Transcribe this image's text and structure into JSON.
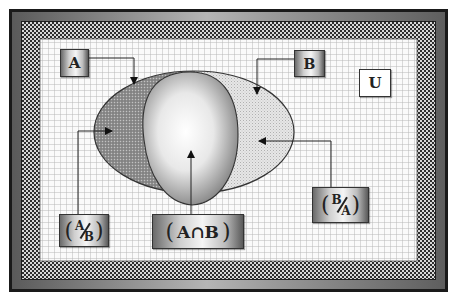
{
  "diagram": {
    "type": "venn",
    "universe_label": "U",
    "sets": [
      {
        "id": "A",
        "label": "A"
      },
      {
        "id": "B",
        "label": "B"
      }
    ],
    "regions": [
      {
        "id": "a_minus_b",
        "label": "A/B",
        "numerator": "A",
        "denominator": "B"
      },
      {
        "id": "a_intersect_b",
        "label": "(A∩B)",
        "open": "(",
        "text": "A∩B",
        "close": ")"
      },
      {
        "id": "b_minus_a",
        "label": "B/A",
        "numerator": "B",
        "denominator": "A"
      }
    ],
    "paren_open": "(",
    "paren_close": ")"
  },
  "colors": {
    "frame_dark": "#1a1a1a",
    "frame_mid": "#8c8c8c",
    "checker_dark": "#2e2e2e",
    "checker_light": "#d8d8d8",
    "grid_bg": "#fafafa",
    "grid_line": "#bdbdbd",
    "set_a_fill": "#8a8a8a",
    "set_b_fill": "#dcdcdc"
  }
}
